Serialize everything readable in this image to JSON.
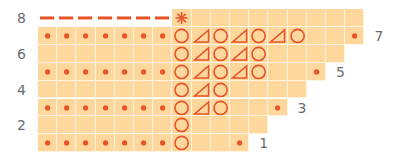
{
  "chart_data": {
    "type": "table",
    "title": "",
    "grid": {
      "left": 38,
      "top": 9,
      "cell_w": 19.2,
      "cell_h": 17.9,
      "rows": 8
    },
    "colors": {
      "cell_fill": "#fdd79c",
      "grid_line": "#fff3e2",
      "symbol": "#e8542a",
      "label": "#6b6b6b"
    },
    "legend_symbols": {
      "dot": "bullet / purl-style dot",
      "O": "yarn over (circle)",
      "T": "decrease (triangle)",
      "*": "asterisk / special stitch",
      "-": "dash (bind-off / cast)",
      "": "empty cell"
    },
    "rows": [
      {
        "row": 8,
        "label": "8",
        "label_side": "left",
        "length": 17,
        "cells": [
          "-",
          "-",
          "-",
          "-",
          "-",
          "-",
          "-",
          "*",
          "",
          "",
          "",
          "",
          "",
          "",
          "",
          "",
          ""
        ]
      },
      {
        "row": 7,
        "label": "7",
        "label_side": "right",
        "length": 17,
        "cells": [
          "dot",
          "dot",
          "dot",
          "dot",
          "dot",
          "dot",
          "dot",
          "O",
          "T",
          "O",
          "T",
          "O",
          "T",
          "O",
          "",
          "",
          "dot"
        ]
      },
      {
        "row": 6,
        "label": "6",
        "label_side": "left",
        "length": 16,
        "cells": [
          "",
          "",
          "",
          "",
          "",
          "",
          "",
          "O",
          "T",
          "O",
          "T",
          "O",
          "",
          "",
          "",
          ""
        ]
      },
      {
        "row": 5,
        "label": "5",
        "label_side": "right",
        "length": 15,
        "cells": [
          "dot",
          "dot",
          "dot",
          "dot",
          "dot",
          "dot",
          "dot",
          "O",
          "T",
          "O",
          "T",
          "O",
          "",
          "",
          "dot"
        ]
      },
      {
        "row": 4,
        "label": "4",
        "label_side": "left",
        "length": 14,
        "cells": [
          "",
          "",
          "",
          "",
          "",
          "",
          "",
          "O",
          "T",
          "O",
          "",
          "",
          "",
          ""
        ]
      },
      {
        "row": 3,
        "label": "3",
        "label_side": "right",
        "length": 13,
        "cells": [
          "dot",
          "dot",
          "dot",
          "dot",
          "dot",
          "dot",
          "dot",
          "O",
          "T",
          "O",
          "",
          "",
          "dot"
        ]
      },
      {
        "row": 2,
        "label": "2",
        "label_side": "left",
        "length": 12,
        "cells": [
          "",
          "",
          "",
          "",
          "",
          "",
          "",
          "O",
          "",
          "",
          "",
          ""
        ]
      },
      {
        "row": 1,
        "label": "1",
        "label_side": "right",
        "length": 11,
        "cells": [
          "dot",
          "dot",
          "dot",
          "dot",
          "dot",
          "dot",
          "dot",
          "O",
          "",
          "",
          "dot"
        ]
      }
    ]
  }
}
